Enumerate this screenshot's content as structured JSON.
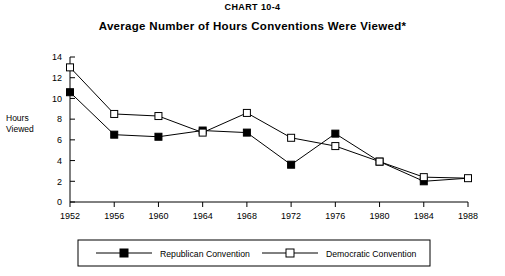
{
  "header": {
    "chart_number": "CHART 10-4",
    "title": "Average Number of Hours Conventions Were Viewed*"
  },
  "axis": {
    "ylabel_line1": "Hours",
    "ylabel_line2": "Viewed"
  },
  "legend": {
    "republican_label": "Republican Convention",
    "democratic_label": "Democratic Convention"
  },
  "colors": {
    "line": "#000000",
    "republican_marker_fill": "#000000",
    "democratic_marker_fill": "#ffffff",
    "background": "#ffffff"
  },
  "chart_data": {
    "type": "line",
    "title": "Average Number of Hours Conventions Were Viewed*",
    "subtitle": "CHART 10-4",
    "xlabel": "",
    "ylabel": "Hours Viewed",
    "x": [
      1952,
      1956,
      1960,
      1964,
      1968,
      1972,
      1976,
      1980,
      1984,
      1988
    ],
    "categories": [
      "1952",
      "1956",
      "1960",
      "1964",
      "1968",
      "1972",
      "1976",
      "1980",
      "1984",
      "1988"
    ],
    "xlim": [
      1952,
      1988
    ],
    "ylim": [
      0,
      14
    ],
    "yticks": [
      0,
      2,
      4,
      6,
      8,
      10,
      12,
      14
    ],
    "ytick_labels": [
      "0",
      "2",
      "4",
      "6",
      "8",
      "10",
      "12",
      "14"
    ],
    "xticks": [
      1952,
      1956,
      1960,
      1964,
      1968,
      1972,
      1976,
      1980,
      1984,
      1988
    ],
    "xtick_labels": [
      "1952",
      "1956",
      "1960",
      "1964",
      "1968",
      "1972",
      "1976",
      "1980",
      "1984",
      "1988"
    ],
    "grid": false,
    "legend_position": "below",
    "series": [
      {
        "name": "Republican Convention",
        "marker": "filled-square",
        "values": [
          10.6,
          6.5,
          6.3,
          6.9,
          6.7,
          3.6,
          6.6,
          3.9,
          2.0,
          2.3
        ]
      },
      {
        "name": "Democratic Convention",
        "marker": "open-square",
        "values": [
          13.0,
          8.5,
          8.3,
          6.7,
          8.6,
          6.2,
          5.4,
          3.9,
          2.4,
          2.3
        ]
      }
    ]
  }
}
